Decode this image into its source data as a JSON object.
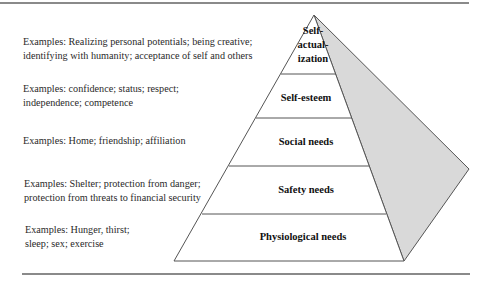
{
  "diagram": {
    "type": "hierarchy-pyramid",
    "levels": [
      {
        "label_lines": [
          "Self-",
          "actual-",
          "ization"
        ],
        "examples": [
          "Examples: Realizing personal potentials; being creative;",
          "identifying with humanity; acceptance of self and others"
        ]
      },
      {
        "label_lines": [
          "Self-esteem"
        ],
        "examples": [
          "Examples: confidence; status; respect;",
          "independence; competence"
        ]
      },
      {
        "label_lines": [
          "Social needs"
        ],
        "examples": [
          "Examples: Home; friendship; affiliation"
        ]
      },
      {
        "label_lines": [
          "Safety needs"
        ],
        "examples": [
          "Examples: Shelter; protection from danger;",
          "protection from threats to financial security"
        ]
      },
      {
        "label_lines": [
          "Physiological needs"
        ],
        "examples": [
          "Examples: Hunger, thirst;",
          "sleep; sex; exercise"
        ]
      }
    ]
  },
  "colors": {
    "side_face": "#d9d9d9",
    "line": "#555555",
    "rule": "#8a8a8a"
  }
}
